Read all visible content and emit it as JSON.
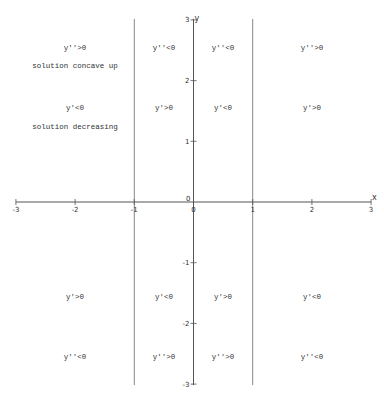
{
  "chart_data": {
    "type": "diagram-sign-chart",
    "title": "",
    "xlabel": "x",
    "ylabel": "y",
    "xlim": [
      -3,
      3
    ],
    "ylim": [
      -3,
      3
    ],
    "grid": false,
    "x_ticks": [
      "-3",
      "-2",
      "-1",
      "0",
      "1",
      "2",
      "3"
    ],
    "y_ticks": [
      "3",
      "2",
      "1",
      "0",
      "-1",
      "-2",
      "-3"
    ],
    "vertical_lines_at_x": [
      -1,
      1
    ],
    "regions": [
      {
        "x": -2,
        "y": 2.55,
        "text": "y''>0"
      },
      {
        "x": -2,
        "y": 2.25,
        "text": "solution concave up"
      },
      {
        "x": -2,
        "y": 1.55,
        "text": "y'<0"
      },
      {
        "x": -2,
        "y": 1.25,
        "text": "solution decreasing"
      },
      {
        "x": -0.5,
        "y": 2.55,
        "text": "y''<0"
      },
      {
        "x": -0.5,
        "y": 1.55,
        "text": "y'>0"
      },
      {
        "x": 0.5,
        "y": 2.55,
        "text": "y''<0"
      },
      {
        "x": 0.5,
        "y": 1.55,
        "text": "y'<0"
      },
      {
        "x": 2,
        "y": 2.55,
        "text": "y''>0"
      },
      {
        "x": 2,
        "y": 1.55,
        "text": "y'>0"
      },
      {
        "x": -2,
        "y": -1.55,
        "text": "y'>0"
      },
      {
        "x": -2,
        "y": -2.55,
        "text": "y''<0"
      },
      {
        "x": -0.5,
        "y": -1.55,
        "text": "y'<0"
      },
      {
        "x": -0.5,
        "y": -2.55,
        "text": "y''>0"
      },
      {
        "x": 0.5,
        "y": -1.55,
        "text": "y'>0"
      },
      {
        "x": 0.5,
        "y": -2.55,
        "text": "y''>0"
      },
      {
        "x": 2,
        "y": -1.55,
        "text": "y'<0"
      },
      {
        "x": 2,
        "y": -2.55,
        "text": "y''<0"
      }
    ],
    "colors": {
      "axis": "#555555",
      "lines": "#888888",
      "text": "#333333"
    }
  }
}
